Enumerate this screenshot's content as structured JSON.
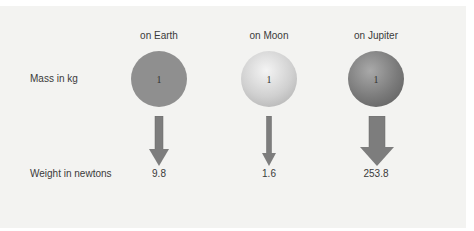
{
  "columns": [
    {
      "label": "on Earth",
      "mass": "1",
      "weight": "9.8"
    },
    {
      "label": "on Moon",
      "mass": "1",
      "weight": "1.6"
    },
    {
      "label": "on Jupiter",
      "mass": "1",
      "weight": "253.8"
    }
  ],
  "rows": {
    "mass_label": "Mass in kg",
    "weight_label": "Weight in newtons"
  },
  "colors": {
    "background": "#f3f3f1",
    "arrow": "#7d7d7d",
    "earth": "#8f8f8f",
    "moon": "#d0d0d0",
    "jupiter": "#7a7a7a"
  }
}
